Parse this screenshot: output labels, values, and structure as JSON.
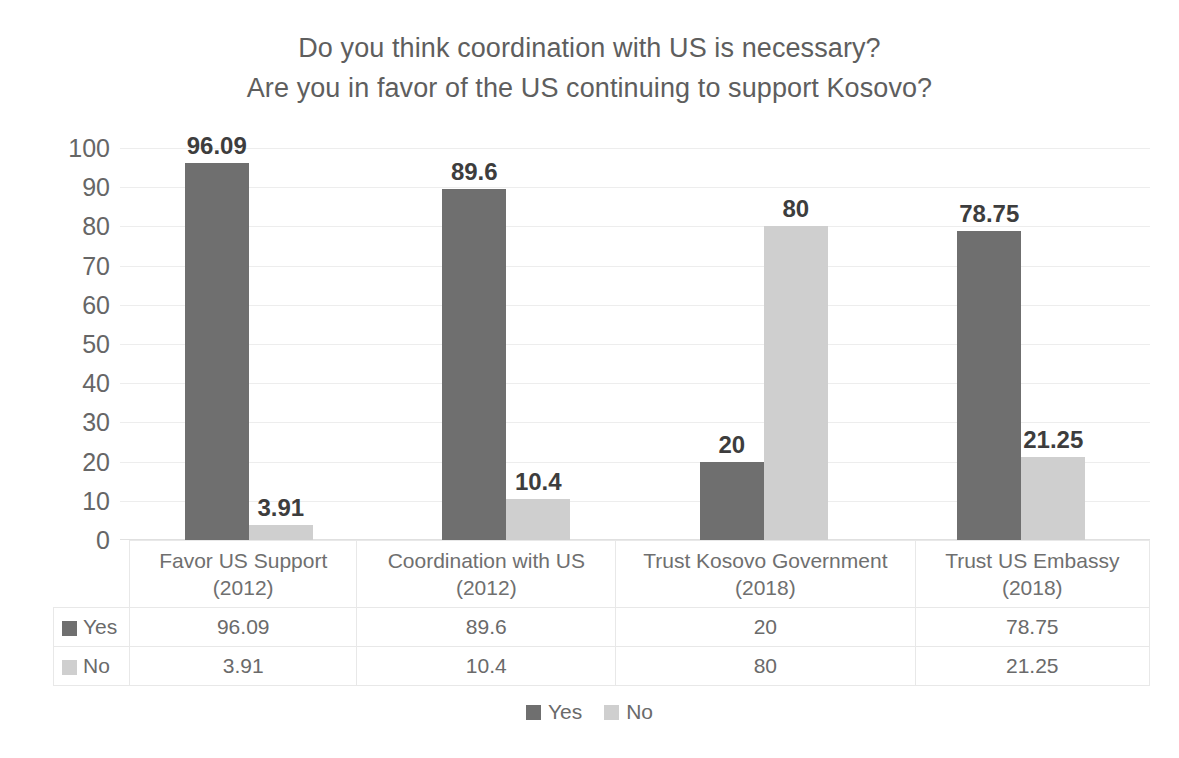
{
  "chart_data": {
    "type": "bar",
    "title": "Do you think coordination with US is necessary?\nAre you in favor of the US continuing to support Kosovo?",
    "title_line1": "Do you think coordination with US is necessary?",
    "title_line2": "Are you in favor of the US continuing to support Kosovo?",
    "xlabel": "",
    "ylabel": "",
    "ylim": [
      0,
      100
    ],
    "ytick_labels": [
      "100",
      "90",
      "80",
      "70",
      "60",
      "50",
      "40",
      "30",
      "20",
      "10",
      "0"
    ],
    "ytick_values": [
      100,
      90,
      80,
      70,
      60,
      50,
      40,
      30,
      20,
      10,
      0
    ],
    "grid": true,
    "grid_axis": "y",
    "legend_position": "bottom",
    "data_table_visible": true,
    "categories": [
      "Favor US Support (2012)",
      "Coordination with US (2012)",
      "Trust Kosovo Government (2018)",
      "Trust US Embassy (2018)"
    ],
    "series": [
      {
        "name": "Yes",
        "color": "#6f6f6f",
        "values": [
          96.09,
          89.6,
          20,
          78.75
        ],
        "labels": [
          "96.09",
          "89.6",
          "20",
          "78.75"
        ]
      },
      {
        "name": "No",
        "color": "#cfcfcf",
        "values": [
          3.91,
          10.4,
          80,
          21.25
        ],
        "labels": [
          "3.91",
          "10.4",
          "80",
          "21.25"
        ]
      }
    ]
  },
  "colors": {
    "series_yes": "#6f6f6f",
    "series_no": "#cfcfcf",
    "text": "#6a6a6a",
    "title": "#5e5e5e",
    "gridline": "#ededed",
    "background": "#ffffff"
  },
  "legend": {
    "items": [
      {
        "label": "Yes",
        "color": "#6f6f6f"
      },
      {
        "label": "No",
        "color": "#cfcfcf"
      }
    ]
  }
}
